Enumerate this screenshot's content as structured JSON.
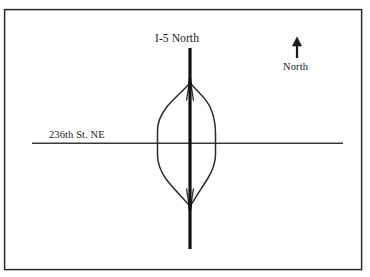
{
  "figure": {
    "kind": "road-interchange-diagram",
    "width": 370,
    "height": 277,
    "background_color": "#ffffff",
    "border_color": "#2b2b2b"
  },
  "labels": {
    "freeway": "I-5 North",
    "street": "236th St. NE",
    "north": "North"
  },
  "icons": {
    "north_arrow": "north-arrow-icon"
  },
  "colors": {
    "ink": "#1a1a1a",
    "freeway_line": "#111111",
    "street_line": "#3a3a3a",
    "ramp_line": "#2b2b2b",
    "border": "#2b2b2b"
  },
  "geometry": {
    "border": {
      "x": 4,
      "y": 9,
      "width": 358,
      "height": 261
    },
    "freeway": {
      "x": 190,
      "y_top": 48,
      "y_bottom": 249,
      "width": 3.2,
      "label_anchor_y": 40
    },
    "street": {
      "y": 143,
      "x_left": 32,
      "x_right": 343,
      "width": 1.4
    },
    "interchange": {
      "center_x": 190,
      "center_y": 143,
      "apex_top_y": 83,
      "apex_bottom_y": 206,
      "left_extent_x": 157,
      "right_extent_x": 216
    },
    "north_arrow": {
      "x": 297,
      "y_tip": 38,
      "y_tail": 58,
      "label_y": 62
    }
  }
}
